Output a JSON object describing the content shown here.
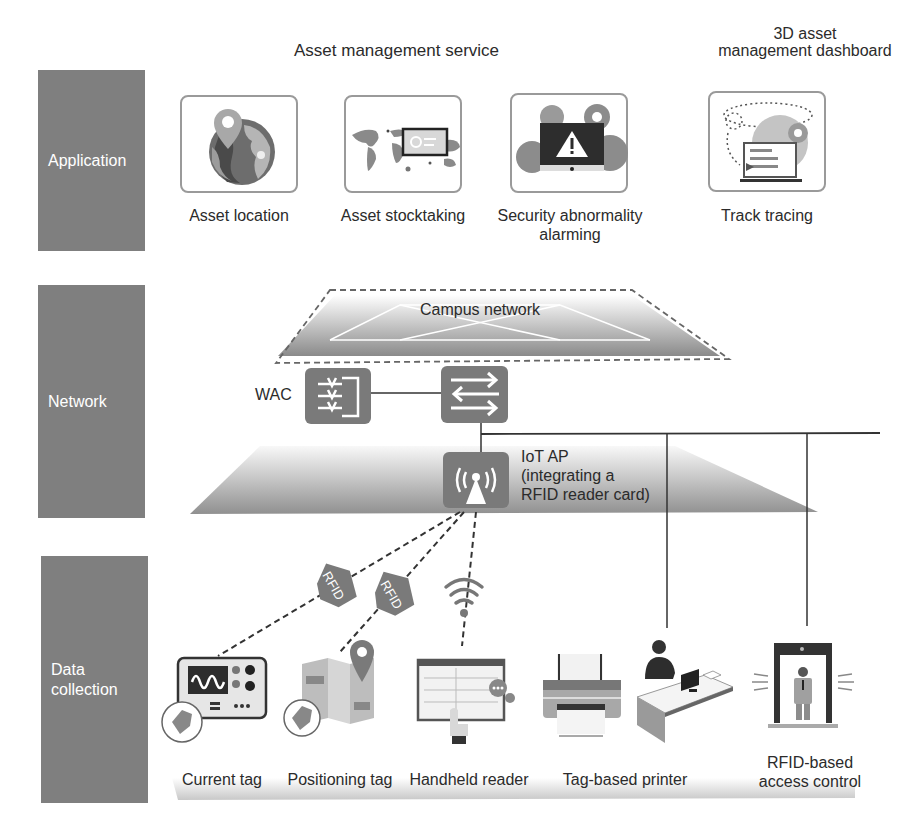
{
  "layers": {
    "application": {
      "label": "Application"
    },
    "network": {
      "label": "Network"
    },
    "data_collection": {
      "label_line1": "Data",
      "label_line2": "collection"
    }
  },
  "application": {
    "group_title_service": "Asset management service",
    "group_title_dashboard_line1": "3D asset",
    "group_title_dashboard_line2": "management dashboard",
    "items": [
      {
        "label": "Asset location",
        "icon": "globe-location-icon"
      },
      {
        "label": "Asset stocktaking",
        "icon": "world-map-monitor-icon"
      },
      {
        "label_line1": "Security abnormality",
        "label_line2": "alarming",
        "icon": "warning-monitor-gears-icon"
      },
      {
        "label": "Track tracing",
        "icon": "laptop-track-icon"
      }
    ]
  },
  "network": {
    "campus_label": "Campus network",
    "wac_label": "WAC",
    "switch_icon": "switch-icon",
    "ap_line1": "IoT AP",
    "ap_line2": "(integrating a",
    "ap_line3": "RFID reader card)"
  },
  "data_collection": {
    "rfid_tag_text": "RFID",
    "items": [
      {
        "label": "Current tag",
        "icon": "oscilloscope-tag-icon"
      },
      {
        "label": "Positioning tag",
        "icon": "map-pin-tag-icon"
      },
      {
        "label": "Handheld reader",
        "icon": "handheld-reader-icon"
      },
      {
        "label": "Tag-based printer",
        "icon": "printer-icon"
      },
      {
        "label": "",
        "icon": "person-desk-computer-icon"
      },
      {
        "label_line1": "RFID-based",
        "label_line2": "access control",
        "icon": "access-gate-icon"
      }
    ]
  },
  "colors": {
    "layer_bg": "#7f7f7f",
    "device_bg": "#7a7a7a",
    "line": "#2a2a2a",
    "text": "#2b2b2b"
  }
}
